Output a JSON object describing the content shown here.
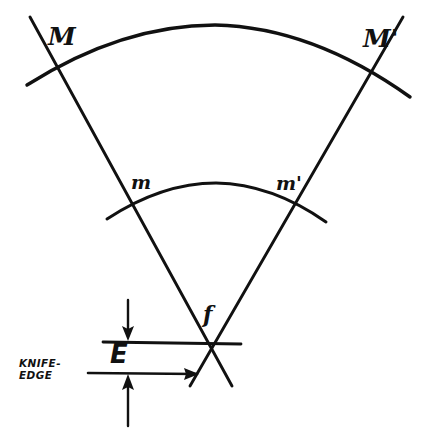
{
  "figure": {
    "background_color": "#ffffff",
    "ink_color": "#111111",
    "width": 431,
    "height": 440
  },
  "labels": {
    "mirror_left": "M",
    "mirror_right": "M'",
    "inner_left": "m",
    "inner_right": "m'",
    "focus": "f",
    "offset": "E",
    "knife_edge_line1": "KNIFE-",
    "knife_edge_line2": "EDGE"
  },
  "elements": {
    "outer_arc_name": "outer-mirror-arc",
    "inner_arc_name": "inner-mirror-arc",
    "left_ray_name": "left-ray-line",
    "right_ray_name": "right-ray-line",
    "upper_reference_line_name": "upper-reference-line",
    "knife_edge_pointer_name": "knife-edge-pointer-line",
    "dimension_arrow_top_name": "dimension-arrow-down",
    "dimension_arrow_bottom_name": "dimension-arrow-up"
  },
  "geometry": {
    "focus_point": {
      "x": 211,
      "y": 342
    },
    "left_ray": {
      "x1": 30,
      "y1": 17,
      "x2": 232,
      "y2": 386
    },
    "right_ray": {
      "x1": 403,
      "y1": 17,
      "x2": 190,
      "y2": 386
    },
    "outer_arc": {
      "start_x": 27,
      "start_y": 85,
      "apex_x": 215,
      "apex_y": 25,
      "end_x": 410,
      "end_y": 97
    },
    "inner_arc": {
      "start_x": 107,
      "start_y": 219,
      "apex_x": 216,
      "apex_y": 183,
      "end_x": 326,
      "end_y": 222
    },
    "upper_reference_line": {
      "x1": 103,
      "y1": 342,
      "x2": 241,
      "y2": 344
    },
    "knife_edge_pointer": {
      "x1": 88,
      "y1": 373,
      "x2": 199,
      "y2": 374
    },
    "dimension_arrow_down": {
      "x": 128,
      "y1": 300,
      "y2": 340
    },
    "dimension_arrow_up": {
      "x": 128,
      "y1": 426,
      "y2": 376
    }
  }
}
